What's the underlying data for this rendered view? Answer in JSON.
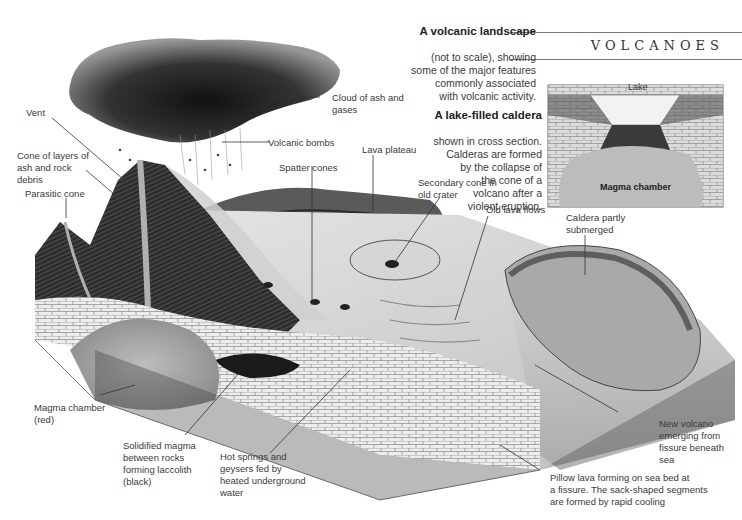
{
  "header": {
    "section_title": "VOLCANOES"
  },
  "main_caption": {
    "title": "A volcanic landscape",
    "body": "(not to scale), showing\nsome of the major features\ncommonly associated\nwith volcanic activity."
  },
  "inset": {
    "caption_title": "A lake-filled caldera",
    "caption_body": "shown in cross section.\nCalderas are formed\nby the collapse of\nthe cone of a\nvolcano after a\nviolent eruption.",
    "labels": {
      "lake": "Lake",
      "magma_chamber": "Magma chamber"
    }
  },
  "labels": {
    "vent": "Vent",
    "cone_layers": "Cone of layers of\nash and rock\ndebris",
    "parasitic_cone": "Parasitic cone",
    "cloud": "Cloud of ash and\ngases",
    "volcanic_bombs": "Volcanic bombs",
    "lava_plateau": "Lava plateau",
    "spatter_cones": "Spatter cones",
    "secondary_cone": "Secondary cone in\nold crater",
    "old_lava_flows": "Old lava flows",
    "caldera_submerged": "Caldera partly\nsubmerged",
    "magma_chamber": "Magma chamber\n(red)",
    "laccolith": "Solidified magma\nbetween rocks\nforming laccolith\n(black)",
    "hot_springs": "Hot springs and\ngeysers fed by\nheated underground\nwater",
    "pillow_lava": "Pillow lava forming on sea bed at\na fissure. The sack-shaped segments\nare formed by rapid cooling",
    "new_volcano": "New volcano\nemerging from\nfissure beneath\nsea"
  },
  "colors": {
    "ink": "#222222",
    "text": "#3a3a3a",
    "rule": "#777777"
  }
}
